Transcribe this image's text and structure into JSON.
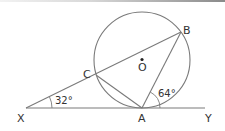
{
  "diagram": {
    "type": "circle-geometry",
    "colors": {
      "stroke": "#6e6e6e",
      "text": "#333333"
    },
    "circle": {
      "center_label": "O",
      "cx": 142,
      "cy": 60,
      "r": 48
    },
    "points": {
      "X": {
        "label": "X",
        "x": 26,
        "y": 108
      },
      "A": {
        "label": "A",
        "x": 142,
        "y": 108
      },
      "Y": {
        "label": "Y",
        "x": 205,
        "y": 108
      },
      "B": {
        "label": "B",
        "x": 181,
        "y": 32
      },
      "C": {
        "label": "C",
        "x": 96,
        "y": 75
      }
    },
    "segments": [
      "XY",
      "XB",
      "AB",
      "AC"
    ],
    "angles": [
      {
        "vertex": "X",
        "label": "32°"
      },
      {
        "vertex": "A",
        "between": "BA-AY",
        "label": "64°"
      }
    ]
  }
}
